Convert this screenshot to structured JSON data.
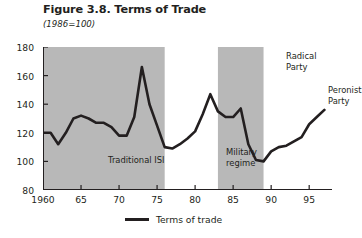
{
  "figure": {
    "title": "Figure 3.8. Terms of Trade",
    "subtitle": "(1986=100)"
  },
  "legend": {
    "label": "Terms of trade",
    "swatch_color": "#231f20"
  },
  "colors": {
    "band": "#b8b8b8",
    "line": "#231f20",
    "axis": "#231f20",
    "background": "#ffffff"
  },
  "annotations": [
    {
      "name": "traditional-isi",
      "text": "Traditional ISI",
      "x": 65,
      "y": 108
    },
    {
      "name": "military-regime",
      "text": "Military\nregime",
      "x": 183,
      "y": 100
    },
    {
      "name": "radical-party",
      "text": "Radical\nParty",
      "x": 243,
      "y": 4
    },
    {
      "name": "peronist-party",
      "text": "Peronist\nParty",
      "x": 285,
      "y": 38
    }
  ],
  "bands": [
    {
      "name": "traditional-isi-band",
      "x0": 1960,
      "x1": 1976
    },
    {
      "name": "radical-party-band",
      "x0": 1983,
      "x1": 1989
    }
  ],
  "chart_data": {
    "type": "line",
    "title": "Figure 3.8. Terms of Trade",
    "subtitle": "(1986=100)",
    "xlabel": "",
    "ylabel": "",
    "xlim": [
      1960,
      1998
    ],
    "ylim": [
      80,
      180
    ],
    "yticks": [
      80,
      100,
      120,
      140,
      160,
      180
    ],
    "ytick_labels": [
      "80",
      "100",
      "120",
      "140",
      "160",
      "180"
    ],
    "xticks": [
      1960,
      1965,
      1970,
      1975,
      1980,
      1985,
      1990,
      1995
    ],
    "xtick_labels": [
      "1960",
      "65",
      "70",
      "75",
      "80",
      "85",
      "90",
      "95"
    ],
    "grid": false,
    "legend_position": "bottom-center",
    "series": [
      {
        "name": "Terms of trade",
        "color": "#231f20",
        "x": [
          1960,
          1961,
          1962,
          1963,
          1964,
          1965,
          1966,
          1967,
          1968,
          1969,
          1970,
          1971,
          1972,
          1973,
          1974,
          1975,
          1976,
          1977,
          1978,
          1979,
          1980,
          1981,
          1982,
          1983,
          1984,
          1985,
          1986,
          1987,
          1988,
          1989,
          1990,
          1991,
          1992,
          1993,
          1994,
          1995,
          1996,
          1997
        ],
        "values": [
          120,
          120,
          112,
          120,
          130,
          132,
          130,
          127,
          127,
          124,
          118,
          118,
          131,
          166,
          140,
          125,
          110,
          109,
          112,
          116,
          121,
          133,
          147,
          135,
          131,
          131,
          137,
          112,
          101,
          100,
          107,
          110,
          111,
          114,
          117,
          126,
          131,
          136
        ]
      }
    ]
  }
}
